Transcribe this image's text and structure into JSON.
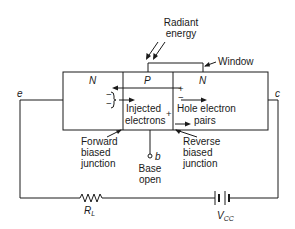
{
  "diagram": {
    "regions": [
      {
        "id": "emitter-region",
        "label": "N"
      },
      {
        "id": "base-region",
        "label": "P"
      },
      {
        "id": "collector-region",
        "label": "N"
      }
    ],
    "radiant_energy": {
      "line1": "Radiant",
      "line2": "energy"
    },
    "window_label": "Window",
    "terminals": {
      "emitter": "e",
      "collector": "c",
      "base": "b"
    },
    "injected_electrons": {
      "line1": "Injected",
      "line2": "electrons"
    },
    "hole_electron_pairs": {
      "line1": "Hole electron",
      "line2": "pairs"
    },
    "forward_junction": {
      "line1": "Forward",
      "line2": "biased",
      "line3": "junction"
    },
    "reverse_junction": {
      "line1": "Reverse",
      "line2": "biased",
      "line3": "junction"
    },
    "base_open": {
      "line1": "Base",
      "line2": "open"
    },
    "resistor": {
      "label": "R",
      "sub": "L"
    },
    "source": {
      "label": "V",
      "sub": "CC"
    },
    "signs": {
      "plus": "+",
      "minus": "−"
    },
    "colors": {
      "line": "#1a1a1a",
      "background": "#ffffff"
    }
  }
}
